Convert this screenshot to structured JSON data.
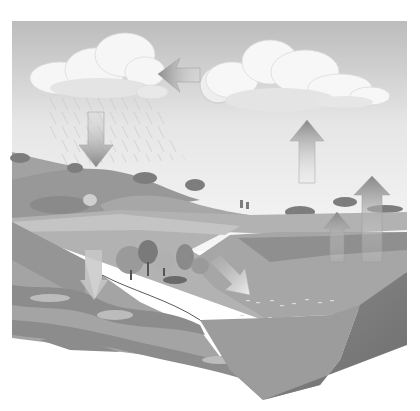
{
  "figure": {
    "elements": [
      {
        "name": "cloud-left",
        "kind": "rain cloud"
      },
      {
        "name": "cloud-right",
        "kind": "cloud"
      },
      {
        "name": "sun",
        "kind": "sun"
      },
      {
        "name": "arrow-condensation",
        "direction": "left"
      },
      {
        "name": "arrow-precipitation",
        "direction": "down"
      },
      {
        "name": "arrow-evaporation",
        "direction": "up"
      },
      {
        "name": "arrow-transpiration",
        "direction": "up"
      },
      {
        "name": "arrow-infiltration",
        "direction": "down"
      },
      {
        "name": "arrow-runoff",
        "direction": "down-right"
      }
    ],
    "colors": {
      "sky_top": "#bdbdbd",
      "sky_bottom": "#f4f4f4",
      "cloud": "#f7f7f7",
      "hills": "#9a9a9a",
      "ground_surface": "#b4b4b4",
      "soil_layers_light": "#a8a8a8",
      "soil_layers_dark": "#8a8a8a",
      "water_surface": "#a9a9a9",
      "water_side": "#7a7a7a",
      "arrow": "#8c8c8c"
    }
  }
}
